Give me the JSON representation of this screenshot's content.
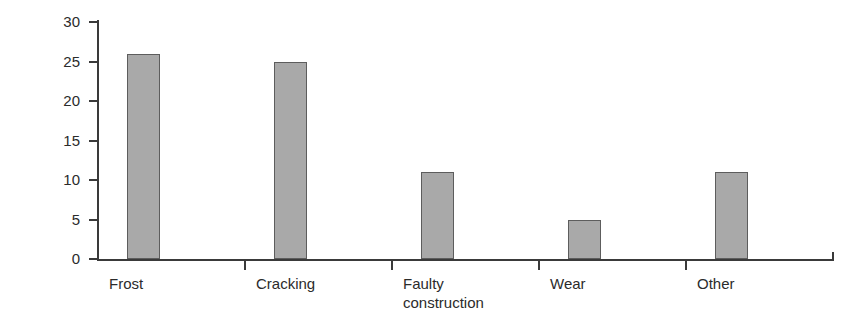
{
  "chart_data": {
    "type": "bar",
    "title": "",
    "xlabel": "",
    "ylabel": "Number",
    "categories": [
      "Frost",
      "Cracking",
      "Faulty\nconstruction",
      "Wear",
      "Other"
    ],
    "values": [
      26,
      25,
      11,
      5,
      11
    ],
    "ylim": [
      0,
      30
    ],
    "ytick_step": 5,
    "yticks": [
      0,
      5,
      10,
      15,
      20,
      25,
      30
    ],
    "ytick_labels": [
      "0",
      "5",
      "10",
      "15",
      "20",
      "25",
      "30"
    ],
    "grid": false,
    "legend": null,
    "legend_position": "none",
    "bar_color": "#a9a9a9",
    "bar_edge_color": "#5d5d5d",
    "axis_color": "#3a3a3a",
    "background_color": "#ffffff"
  }
}
